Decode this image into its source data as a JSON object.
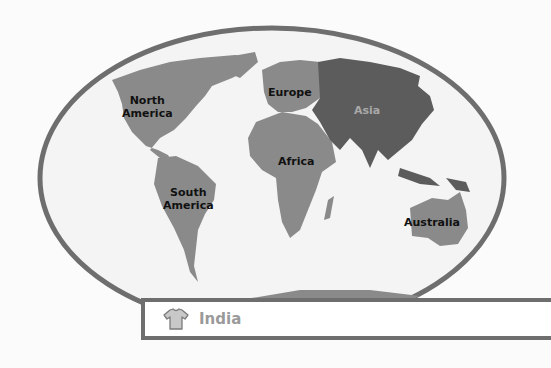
{
  "map": {
    "title": "World continents map",
    "colors": {
      "background": "#fbfbfb",
      "ocean": "#f4f4f4",
      "border": "#6e6e6e",
      "land": "#8a8a8a",
      "asia_highlight": "#5c5c5c",
      "label": "#111111",
      "asia_label": "#a9a9a9"
    },
    "labels": {
      "north_america": "North\nAmerica",
      "north_america_line1": "North",
      "north_america_line2": "America",
      "europe": "Europe",
      "asia": "Asia",
      "africa": "Africa",
      "south_america_line1": "South",
      "south_america_line2": "America",
      "australia": "Australia"
    },
    "highlighted_continent": "Asia"
  },
  "answer_box": {
    "icon": "t-shirt-icon",
    "text": "India"
  }
}
